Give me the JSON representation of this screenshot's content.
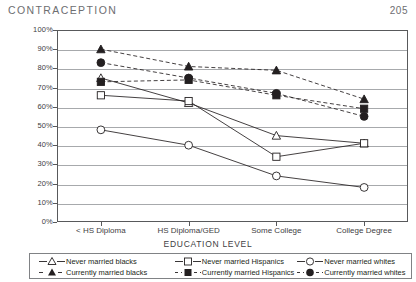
{
  "header": {
    "title": "CONTRACEPTION",
    "page_number": "205"
  },
  "chart_data": {
    "type": "line",
    "title": "",
    "xlabel": "EDUCATION LEVEL",
    "ylabel": "",
    "categories": [
      "< HS Diploma",
      "HS Diploma/GED",
      "Some College",
      "College Degree"
    ],
    "ylim": [
      0,
      100
    ],
    "ytick_labels": [
      "0%",
      "10%",
      "20%",
      "30%",
      "40%",
      "50%",
      "60%",
      "70%",
      "80%",
      "90%",
      "100%"
    ],
    "ytick_values": [
      0,
      10,
      20,
      30,
      40,
      50,
      60,
      70,
      80,
      90,
      100
    ],
    "grid": true,
    "legend_position": "bottom",
    "series": [
      {
        "name": "Never married blacks",
        "marker": "open-triangle",
        "line": "solid",
        "values": [
          75,
          62,
          45,
          41
        ]
      },
      {
        "name": "Never married Hispanics",
        "marker": "open-square",
        "line": "solid",
        "values": [
          66,
          63,
          34,
          41
        ]
      },
      {
        "name": "Never married whites",
        "marker": "open-circle",
        "line": "solid",
        "values": [
          48,
          40,
          24,
          18
        ]
      },
      {
        "name": "Currently married blacks",
        "marker": "filled-triangle",
        "line": "dashed",
        "values": [
          90,
          81,
          79,
          64
        ]
      },
      {
        "name": "Currently married Hispanics",
        "marker": "filled-square",
        "line": "dashed",
        "values": [
          73,
          74,
          66,
          59
        ]
      },
      {
        "name": "Currently married whites",
        "marker": "filled-circle",
        "line": "dashed",
        "values": [
          83,
          75,
          67,
          55
        ]
      }
    ]
  },
  "colors": {
    "ink": "#231f20",
    "grid": "#a7a9ac",
    "axis": "#58595b",
    "header": "#6d6e71"
  }
}
